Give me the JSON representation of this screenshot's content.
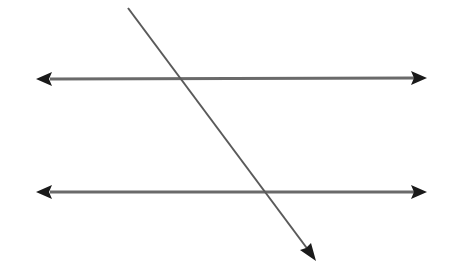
{
  "diagram": {
    "title": "Two parallel lines cut by a transversal",
    "elements": [
      {
        "id": "parallel-line-top",
        "kind": "line",
        "arrows": "both"
      },
      {
        "id": "parallel-line-bottom",
        "kind": "line",
        "arrows": "both"
      },
      {
        "id": "transversal",
        "kind": "ray",
        "arrows": "end"
      }
    ],
    "colors": {
      "line": "#6a6a6a",
      "transversal": "#5a5a5a",
      "arrowhead": "#1a1a1a",
      "background": "#ffffff"
    }
  }
}
